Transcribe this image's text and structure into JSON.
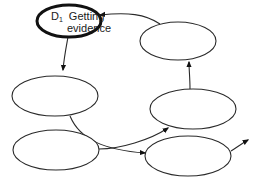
{
  "diagram": {
    "type": "cycle-flow",
    "nodes": [
      {
        "id": "d1",
        "label_prefix": "D",
        "label_subscript": "1",
        "line1": "Getting",
        "line2": "evidence",
        "highlighted": true
      },
      {
        "id": "n2",
        "label": ""
      },
      {
        "id": "n3",
        "label": ""
      },
      {
        "id": "n4",
        "label": ""
      },
      {
        "id": "n5",
        "label": ""
      },
      {
        "id": "n6",
        "label": ""
      }
    ],
    "edges": [
      {
        "from": "d1",
        "to": "n3"
      },
      {
        "from": "n3",
        "to": "n6"
      },
      {
        "from": "n5",
        "to": "n4"
      },
      {
        "from": "n4",
        "to": "n2"
      },
      {
        "from": "n2",
        "to": "d1"
      },
      {
        "from": "n6",
        "to": "exit"
      }
    ],
    "colors": {
      "stroke": "#2a2a2a",
      "highlight_stroke": "#111111",
      "background": "#ffffff"
    }
  }
}
